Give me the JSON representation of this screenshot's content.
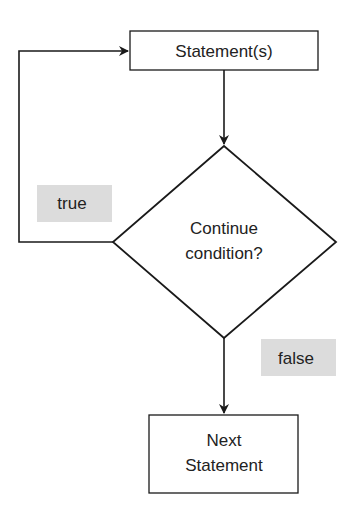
{
  "diagram": {
    "type": "flowchart",
    "nodes": {
      "statements": {
        "label": "Statement(s)",
        "shape": "rectangle"
      },
      "condition": {
        "line1": "Continue",
        "line2": "condition?",
        "shape": "diamond"
      },
      "next": {
        "line1": "Next",
        "line2": "Statement",
        "shape": "rectangle"
      }
    },
    "edges": [
      {
        "from": "statements",
        "to": "condition",
        "label": ""
      },
      {
        "from": "condition",
        "to": "statements",
        "label": "true"
      },
      {
        "from": "condition",
        "to": "next",
        "label": "false"
      }
    ],
    "labels": {
      "true": "true",
      "false": "false"
    },
    "colors": {
      "stroke": "#1a1a1a",
      "label_bg": "#dcdcdc",
      "text": "#222222",
      "background": "#ffffff"
    }
  }
}
